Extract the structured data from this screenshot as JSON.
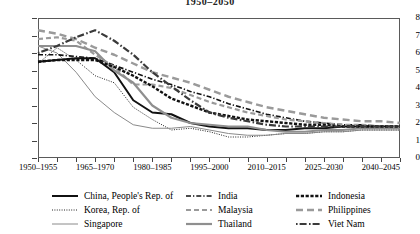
{
  "title": "1950–2050",
  "axes": {
    "y_ticks": [
      "0",
      "1",
      "2",
      "3",
      "4",
      "5",
      "6",
      "7",
      "8"
    ],
    "x_labels": [
      "1950–1955",
      "1965–1970",
      "1980–1985",
      "1995–2000",
      "2010–2015",
      "2025–2030",
      "2040–2045"
    ]
  },
  "legend": {
    "columns": [
      [
        {
          "label": "China, People's Rep. of",
          "key": "china"
        },
        {
          "label": "Korea, Rep. of",
          "key": "korea"
        },
        {
          "label": "Singapore",
          "key": "singapore"
        }
      ],
      [
        {
          "label": "India",
          "key": "india"
        },
        {
          "label": "Malaysia",
          "key": "malaysia"
        },
        {
          "label": "Thailand",
          "key": "thailand"
        }
      ],
      [
        {
          "label": "Indonesia",
          "key": "indonesia"
        },
        {
          "label": "Philippines",
          "key": "philippines"
        },
        {
          "label": "Viet Nam",
          "key": "vietnam"
        }
      ]
    ]
  },
  "chart_data": {
    "type": "line",
    "title": "1950–2050",
    "xlabel": "",
    "ylabel": "",
    "ylim": [
      0,
      8
    ],
    "grid": false,
    "legend_position": "bottom",
    "x": [
      "1950–1955",
      "1955–1960",
      "1960–1965",
      "1965–1970",
      "1970–1975",
      "1975–1980",
      "1980–1985",
      "1985–1990",
      "1990–1995",
      "1995–2000",
      "2000–2005",
      "2005–2010",
      "2010–2015",
      "2015–2020",
      "2020–2025",
      "2025–2030",
      "2030–2035",
      "2035–2040",
      "2040–2045",
      "2045–2050"
    ],
    "series": [
      {
        "name": "China, People's Rep. of",
        "key": "china",
        "color": "#111111",
        "style": "solid",
        "width": 2.0,
        "values": [
          5.5,
          5.6,
          5.7,
          5.7,
          4.9,
          3.3,
          2.6,
          2.5,
          2.0,
          1.8,
          1.7,
          1.7,
          1.6,
          1.6,
          1.7,
          1.7,
          1.8,
          1.8,
          1.8,
          1.8
        ]
      },
      {
        "name": "Korea, Rep. of",
        "key": "korea",
        "color": "#222222",
        "style": "dotted-fine",
        "width": 1.0,
        "values": [
          5.4,
          6.3,
          5.6,
          4.7,
          4.3,
          2.9,
          2.2,
          1.6,
          1.7,
          1.5,
          1.2,
          1.2,
          1.3,
          1.4,
          1.4,
          1.5,
          1.5,
          1.6,
          1.6,
          1.6
        ]
      },
      {
        "name": "Singapore",
        "key": "singapore",
        "color": "#8a8a8a",
        "style": "solid",
        "width": 1.0,
        "values": [
          6.4,
          6.0,
          4.9,
          3.5,
          2.6,
          1.9,
          1.7,
          1.7,
          1.8,
          1.6,
          1.4,
          1.3,
          1.3,
          1.4,
          1.4,
          1.5,
          1.5,
          1.6,
          1.6,
          1.6
        ]
      },
      {
        "name": "India",
        "key": "india",
        "color": "#111111",
        "style": "dashdot",
        "width": 1.6,
        "values": [
          5.9,
          5.9,
          5.8,
          5.7,
          5.3,
          4.9,
          4.5,
          4.2,
          3.8,
          3.5,
          3.1,
          2.8,
          2.5,
          2.3,
          2.1,
          2.0,
          1.9,
          1.9,
          1.8,
          1.8
        ]
      },
      {
        "name": "Malaysia",
        "key": "malaysia",
        "color": "#9a9a9a",
        "style": "dashed",
        "width": 2.2,
        "values": [
          6.8,
          6.9,
          6.7,
          5.9,
          5.2,
          4.2,
          4.2,
          4.0,
          3.6,
          3.2,
          2.9,
          2.6,
          2.4,
          2.2,
          2.1,
          2.0,
          1.9,
          1.9,
          1.8,
          1.8
        ]
      },
      {
        "name": "Thailand",
        "key": "thailand",
        "color": "#8f8f8f",
        "style": "solid",
        "width": 2.2,
        "values": [
          6.4,
          6.4,
          6.4,
          6.1,
          5.0,
          4.3,
          3.0,
          2.3,
          2.0,
          1.9,
          1.8,
          1.8,
          1.6,
          1.5,
          1.5,
          1.6,
          1.6,
          1.7,
          1.7,
          1.7
        ]
      },
      {
        "name": "Indonesia",
        "key": "indonesia",
        "color": "#111111",
        "style": "dash-thick",
        "width": 2.4,
        "values": [
          5.5,
          5.6,
          5.6,
          5.6,
          5.2,
          4.7,
          4.1,
          3.4,
          3.0,
          2.6,
          2.4,
          2.2,
          2.1,
          2.0,
          1.9,
          1.9,
          1.8,
          1.8,
          1.8,
          1.8
        ]
      },
      {
        "name": "Philippines",
        "key": "philippines",
        "color": "#9a9a9a",
        "style": "longdash",
        "width": 2.4,
        "values": [
          7.3,
          7.1,
          6.8,
          6.3,
          5.9,
          5.4,
          4.9,
          4.6,
          4.3,
          3.9,
          3.5,
          3.2,
          2.9,
          2.7,
          2.5,
          2.3,
          2.2,
          2.1,
          2.1,
          2.0
        ]
      },
      {
        "name": "Viet Nam",
        "key": "vietnam",
        "color": "#3a3a3a",
        "style": "dashdot-long",
        "width": 2.2,
        "values": [
          6.0,
          6.4,
          6.9,
          7.3,
          6.7,
          5.9,
          4.9,
          4.1,
          3.3,
          2.6,
          2.3,
          2.1,
          1.9,
          1.8,
          1.8,
          1.8,
          1.8,
          1.8,
          1.8,
          1.8
        ]
      }
    ]
  }
}
